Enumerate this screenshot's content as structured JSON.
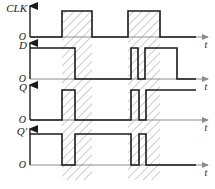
{
  "figure": {
    "type": "timing-diagram",
    "width": 215,
    "height": 189,
    "background_color": "#ffffff",
    "line_color": "#1a1a1a",
    "axis_color": "#8c8c8c",
    "hatch_color": "#9a9a9a",
    "hatch_fill": "#ffffff"
  },
  "rows": [
    {
      "id": "clk",
      "signal_label": "CLK",
      "origin_label": "O",
      "time_axis_label": "t",
      "baseline_y": 37,
      "high_y": 11,
      "axis_top_y": 6,
      "axis_end_x": 208,
      "origin_x": 30,
      "segments": [
        {
          "from_x": 30,
          "to_x": 62,
          "level": "low"
        },
        {
          "from_x": 62,
          "to_x": 92,
          "level": "high"
        },
        {
          "from_x": 92,
          "to_x": 128,
          "level": "low"
        },
        {
          "from_x": 128,
          "to_x": 160,
          "level": "high"
        },
        {
          "from_x": 160,
          "to_x": 196,
          "level": "low"
        }
      ]
    },
    {
      "id": "d",
      "signal_label": "D",
      "origin_label": "O",
      "time_axis_label": "t",
      "baseline_y": 79,
      "high_y": 48,
      "axis_top_y": 43,
      "axis_end_x": 208,
      "origin_x": 30,
      "segments": [
        {
          "from_x": 30,
          "to_x": 75,
          "level": "high"
        },
        {
          "from_x": 75,
          "to_x": 131,
          "level": "low"
        },
        {
          "from_x": 131,
          "to_x": 138,
          "level": "high"
        },
        {
          "from_x": 138,
          "to_x": 145,
          "level": "low"
        },
        {
          "from_x": 145,
          "to_x": 177,
          "level": "high"
        },
        {
          "from_x": 177,
          "to_x": 196,
          "level": "low"
        }
      ]
    },
    {
      "id": "q",
      "signal_label": "Q",
      "origin_label": "O",
      "time_axis_label": "t",
      "baseline_y": 120,
      "high_y": 90,
      "axis_top_y": 85,
      "axis_end_x": 208,
      "origin_x": 30,
      "segments": [
        {
          "from_x": 30,
          "to_x": 62,
          "level": "low"
        },
        {
          "from_x": 62,
          "to_x": 75,
          "level": "high"
        },
        {
          "from_x": 75,
          "to_x": 131,
          "level": "low"
        },
        {
          "from_x": 131,
          "to_x": 139,
          "level": "high"
        },
        {
          "from_x": 139,
          "to_x": 146,
          "level": "low"
        },
        {
          "from_x": 146,
          "to_x": 196,
          "level": "high"
        }
      ]
    },
    {
      "id": "qprime",
      "signal_label": "Q'",
      "origin_label": "O",
      "time_axis_label": "t",
      "baseline_y": 165,
      "high_y": 134,
      "axis_top_y": 129,
      "axis_end_x": 208,
      "origin_x": 30,
      "segments": [
        {
          "from_x": 30,
          "to_x": 62,
          "level": "high"
        },
        {
          "from_x": 62,
          "to_x": 75,
          "level": "low"
        },
        {
          "from_x": 75,
          "to_x": 131,
          "level": "high"
        },
        {
          "from_x": 131,
          "to_x": 139,
          "level": "low"
        },
        {
          "from_x": 139,
          "to_x": 146,
          "level": "high"
        },
        {
          "from_x": 146,
          "to_x": 196,
          "level": "low"
        }
      ]
    }
  ],
  "clock_bands": [
    {
      "from_x": 62,
      "to_x": 92,
      "top_y": 11,
      "bottom_y": 180
    },
    {
      "from_x": 128,
      "to_x": 160,
      "top_y": 11,
      "bottom_y": 180
    }
  ],
  "chart_data": {
    "type": "line",
    "title": "",
    "xlabel": "t",
    "ylabel": "",
    "series": [
      {
        "name": "CLK",
        "levels": [
          0,
          1,
          0,
          1,
          0
        ],
        "transitions_x": [
          30,
          62,
          92,
          128,
          160,
          196
        ]
      },
      {
        "name": "D",
        "levels": [
          1,
          0,
          1,
          0,
          1,
          0
        ],
        "transitions_x": [
          30,
          75,
          131,
          138,
          145,
          177,
          196
        ]
      },
      {
        "name": "Q",
        "levels": [
          0,
          1,
          0,
          1,
          0,
          1
        ],
        "transitions_x": [
          30,
          62,
          75,
          131,
          139,
          146,
          196
        ]
      },
      {
        "name": "Q'",
        "levels": [
          1,
          0,
          1,
          0,
          1,
          0
        ],
        "transitions_x": [
          30,
          62,
          75,
          131,
          139,
          146,
          196
        ]
      }
    ],
    "legend_position": "left-axis-labels",
    "grid": false
  }
}
